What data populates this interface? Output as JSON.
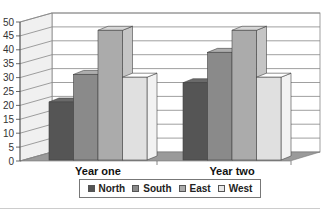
{
  "chart_data": {
    "type": "bar",
    "style": "3d-clustered-column",
    "title": "",
    "xlabel": "",
    "ylabel": "",
    "categories": [
      "Year one",
      "Year two"
    ],
    "series": [
      {
        "name": "North",
        "values": [
          21,
          28
        ],
        "color": "#555555"
      },
      {
        "name": "South",
        "values": [
          31,
          39
        ],
        "color": "#8a8a8a"
      },
      {
        "name": "East",
        "values": [
          47,
          47
        ],
        "color": "#ababab"
      },
      {
        "name": "West",
        "values": [
          30,
          30
        ],
        "color": "#e0e0e0"
      }
    ],
    "ylim": [
      0,
      50
    ],
    "yticks": [
      0,
      5,
      10,
      15,
      20,
      25,
      30,
      35,
      40,
      45,
      50
    ],
    "grid": true,
    "legend_position": "bottom"
  },
  "legend": {
    "items": [
      {
        "label": "North",
        "color": "#555555"
      },
      {
        "label": "South",
        "color": "#8a8a8a"
      },
      {
        "label": "East",
        "color": "#ababab"
      },
      {
        "label": "West",
        "color": "#e8e8e8"
      }
    ]
  }
}
